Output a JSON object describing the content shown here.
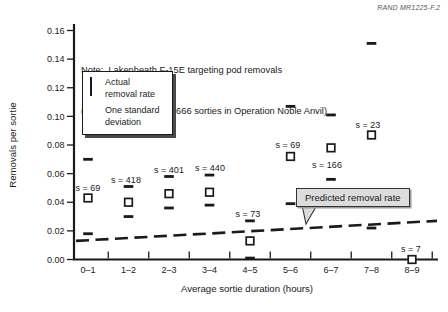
{
  "figure_label": "RAND MR1225-F.2",
  "note": {
    "line1": "Note:  Lakenheath F-15E targeting pod removals",
    "line2": "(n = 82 removals, s = 1666 sorties in Operation Noble Anvil)"
  },
  "legend": {
    "items": [
      {
        "marker": "square",
        "line1": "Actual",
        "line2": "removal rate"
      },
      {
        "marker": "dash",
        "line1": "One standard",
        "line2": "deviation"
      }
    ]
  },
  "callout": {
    "label": "Predicted removal rate"
  },
  "chart_data": {
    "type": "scatter",
    "title": "",
    "categories": [
      "0–1",
      "1–2",
      "2–3",
      "3–4",
      "4–5",
      "5–6",
      "6–7",
      "7–8",
      "8–9"
    ],
    "xlabel": "Average sortie duration (hours)",
    "ylabel": "Removals per sortie",
    "ylim": [
      0,
      0.16
    ],
    "y_tick_labels": [
      "0.16",
      "0.14",
      "0.12",
      "0.10",
      "0.08",
      "0.06",
      "0.04",
      "0.02",
      "0.00"
    ],
    "grid": false,
    "legend_position": "upper-left",
    "series": [
      {
        "name": "Actual removal rate",
        "marker": "square",
        "values": [
          0.043,
          0.04,
          0.046,
          0.047,
          0.013,
          0.072,
          0.078,
          0.087,
          0.0
        ]
      },
      {
        "name": "One standard deviation (upper)",
        "marker": "dash",
        "values": [
          0.07,
          0.051,
          0.058,
          0.059,
          0.027,
          0.107,
          0.101,
          0.151,
          null
        ]
      },
      {
        "name": "One standard deviation (lower)",
        "marker": "dash",
        "values": [
          0.018,
          0.03,
          0.036,
          0.038,
          0.001,
          0.039,
          0.056,
          0.022,
          null
        ]
      },
      {
        "name": "Predicted removal rate",
        "type": "dashed-line",
        "start": 0.013,
        "end": 0.027
      }
    ],
    "point_labels": [
      {
        "text": "s = 69",
        "x": 88,
        "y": 191
      },
      {
        "text": "s = 418",
        "x": 126,
        "y": 183
      },
      {
        "text": "s = 401",
        "x": 169,
        "y": 173
      },
      {
        "text": "s = 440",
        "x": 210,
        "y": 171
      },
      {
        "text": "s = 73",
        "x": 248,
        "y": 217
      },
      {
        "text": "s = 69",
        "x": 288,
        "y": 148
      },
      {
        "text": "s = 166",
        "x": 327,
        "y": 168
      },
      {
        "text": "s = 23",
        "x": 368,
        "y": 128
      },
      {
        "text": "s = 7",
        "x": 411,
        "y": 252
      }
    ],
    "layout": {
      "x_left": 74,
      "x_right": 438,
      "y_zero": 259.5,
      "y_top": 30.5,
      "y_axis_top": 24,
      "cat_center0": 88,
      "cat_step": 40.5,
      "tick_font": 9,
      "title_font": 9.6,
      "ink": "#1a1a1a",
      "callout_fill": "#dcdcdc",
      "callout_tail": "302,205 317,205 306,224"
    }
  }
}
